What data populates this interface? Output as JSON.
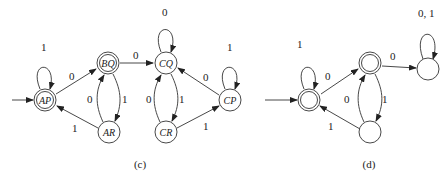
{
  "diagram_c": {
    "caption": "(c)",
    "states": {
      "AP": {
        "label": "AP",
        "accepting": true,
        "initial": true
      },
      "BQ": {
        "label": "BQ",
        "accepting": true,
        "initial": false
      },
      "AR": {
        "label": "AR",
        "accepting": false,
        "initial": false
      },
      "CQ": {
        "label": "CQ",
        "accepting": false,
        "initial": false
      },
      "CR": {
        "label": "CR",
        "accepting": false,
        "initial": false
      },
      "CP": {
        "label": "CP",
        "accepting": false,
        "initial": false
      }
    },
    "transitions": {
      "ap_ap": "1",
      "ap_bq": "0",
      "bq_cq": "0",
      "bq_ar": "1",
      "ar_bq": "0",
      "ar_ap": "1",
      "cq_cq": "0",
      "cq_cr": "1",
      "cr_cq": "0",
      "cr_cp": "1",
      "cp_cq": "0",
      "cp_cp": "1"
    }
  },
  "diagram_d": {
    "caption": "(d)",
    "transitions": {
      "s1_s1": "1",
      "s1_s2": "0",
      "s2_s4": "0",
      "s2_s3": "1",
      "s3_s2": "0",
      "s3_s1": "1",
      "s4_s4": "0, 1"
    }
  }
}
